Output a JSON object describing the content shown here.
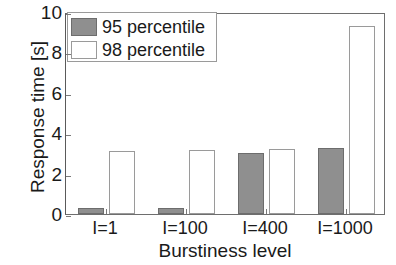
{
  "chart_data": {
    "type": "bar",
    "title": "",
    "subtitle": "",
    "xlabel": "Burstiness level",
    "ylabel": "Response time [s]",
    "categories": [
      "I=1",
      "I=100",
      "I=400",
      "I=1000"
    ],
    "series": [
      {
        "name": "95 percentile",
        "values": [
          0.3,
          0.28,
          3.0,
          3.25
        ],
        "color": "#8f8f8f",
        "fill": "gray"
      },
      {
        "name": "98 percentile",
        "values": [
          3.1,
          3.15,
          3.2,
          9.3
        ],
        "color": "#ffffff",
        "fill": "white"
      }
    ],
    "ylim": [
      0,
      10
    ],
    "yticks": [
      0,
      2,
      4,
      6,
      8,
      10
    ],
    "ytick_labels": [
      "0",
      "2",
      "4",
      "6",
      "8",
      "10"
    ],
    "grid": false,
    "legend_position": "upper left",
    "legend_entries": [
      "95 percentile",
      "98 percentile"
    ]
  }
}
